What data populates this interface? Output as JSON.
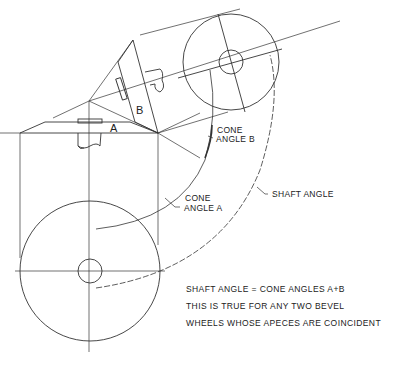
{
  "diagram": {
    "labels": {
      "wheel_a": "A",
      "wheel_b": "B",
      "cone_angle_b": [
        "CONE",
        "ANGLE B"
      ],
      "cone_angle_a": [
        "CONE",
        "ANGLE A"
      ],
      "shaft_angle": "SHAFT ANGLE"
    },
    "notes": [
      "SHAFT ANGLE = CONE ANGLES A+B",
      "THIS IS TRUE FOR ANY TWO BEVEL",
      "WHEELS WHOSE APECES ARE COINCIDENT"
    ],
    "colors": {
      "line": "#333333",
      "background": "#ffffff"
    }
  }
}
